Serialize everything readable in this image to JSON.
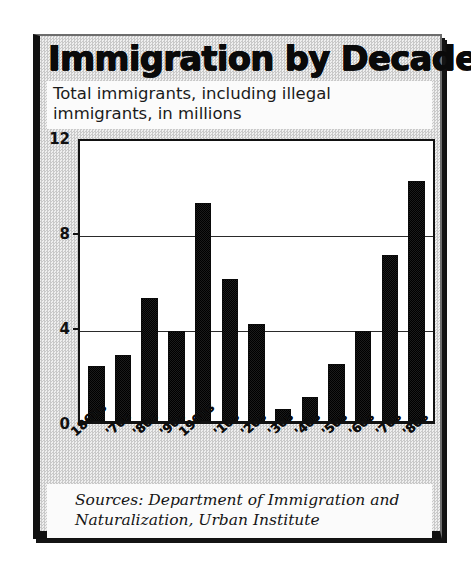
{
  "chart_data": {
    "type": "bar",
    "title": "Immigration by Decade",
    "subtitle": "Total immigrants, including illegal immigrants, in millions",
    "categories": [
      "1860s",
      "'70s",
      "'80s",
      "'90s",
      "1900s",
      "'10s",
      "'20s",
      "'30s",
      "'40s",
      "'50s",
      "'60s",
      "'70s",
      "'80s"
    ],
    "values": [
      2.3,
      2.8,
      5.2,
      3.8,
      9.2,
      6.0,
      4.1,
      0.5,
      1.0,
      2.4,
      3.8,
      7.0,
      10.1
    ],
    "xlabel": "",
    "ylabel": "",
    "ylim": [
      0,
      12
    ],
    "yticks": [
      0,
      4,
      8,
      12
    ],
    "ytick_labels": [
      "0",
      "4",
      "8",
      "12"
    ],
    "gridlines": [
      4,
      8
    ],
    "grid": true,
    "legend": false,
    "bar_color": "#111111",
    "plot_background": "#ffffff",
    "figure_background": "#dcdcdc"
  },
  "source": {
    "text": "Sources: Department of Immigration and Naturalization, Urban Institute"
  }
}
